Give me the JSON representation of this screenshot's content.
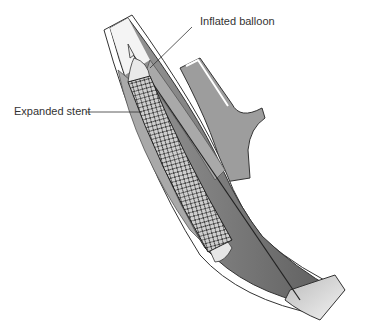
{
  "diagram": {
    "type": "medical-illustration",
    "labels": [
      {
        "id": "balloon",
        "text": "Inflated balloon"
      },
      {
        "id": "stent",
        "text": "Expanded stent"
      }
    ],
    "colors": {
      "vessel_dark": "#6e6e6e",
      "vessel_light": "#d9d9d9",
      "plaque": "#a8a8a8",
      "line": "#333333"
    }
  }
}
